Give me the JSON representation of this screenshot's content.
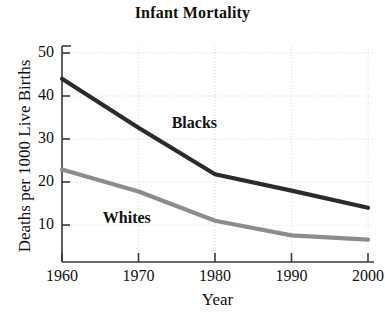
{
  "chart_data": {
    "type": "line",
    "title": "Infant Mortality",
    "xlabel": "Year",
    "ylabel": "Deaths per 1000 Live Births",
    "x": [
      1960,
      1970,
      1980,
      1990,
      2000
    ],
    "xtick_labels": [
      "1960",
      "1970",
      "1980",
      "1990",
      "2000"
    ],
    "ytick_labels": [
      "10",
      "20",
      "30",
      "40",
      "50"
    ],
    "yticks": [
      10,
      20,
      30,
      40,
      50
    ],
    "xlim": [
      1960,
      2000
    ],
    "ylim": [
      1.4,
      50
    ],
    "grid": "dotted-light",
    "legend_position": "inline-annotations",
    "series": [
      {
        "name": "Blacks",
        "label": "Blacks",
        "color": "#2b2b2b",
        "values": [
          44.0,
          32.6,
          21.8,
          18.0,
          14.0
        ]
      },
      {
        "name": "Whites",
        "label": "Whites",
        "color": "#8c8c8c",
        "values": [
          22.9,
          17.8,
          11.0,
          7.6,
          6.6
        ]
      }
    ],
    "annotations": [
      {
        "text": "Blacks",
        "x": 1978,
        "y": 33.5
      },
      {
        "text": "Whites",
        "x": 1969,
        "y": 11.5
      }
    ],
    "axis_color": "#3a3a3a",
    "grid_color": "#d8d8d8",
    "background": "#ffffff"
  }
}
